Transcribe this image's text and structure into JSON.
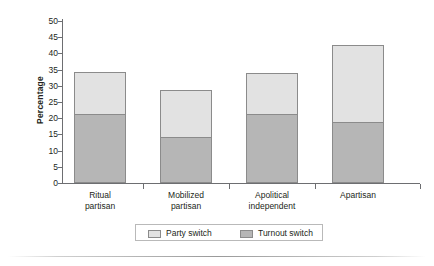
{
  "chart_data": {
    "type": "bar",
    "stacked": true,
    "title": "",
    "xlabel": "",
    "ylabel": "Percentage",
    "ylim": [
      0,
      50
    ],
    "ytick_labels": [
      "0",
      "5",
      "10",
      "15",
      "20",
      "25",
      "30",
      "35",
      "40",
      "45",
      "50"
    ],
    "ytick_values": [
      0,
      5,
      10,
      15,
      20,
      25,
      30,
      35,
      40,
      45,
      50
    ],
    "grid": false,
    "legend_position": "bottom",
    "categories": [
      "Ritual partisan",
      "Mobilized partisan",
      "Apolitical independent",
      "Apartisan"
    ],
    "category_lines": [
      [
        "Ritual",
        "partisan"
      ],
      [
        "Mobilized",
        "partisan"
      ],
      [
        "Apolitical",
        "independent"
      ],
      [
        "Apartisan",
        ""
      ]
    ],
    "series": [
      {
        "name": "Turnout switch",
        "color": "#b6b6b6",
        "values": [
          21.0,
          14.0,
          21.0,
          18.5
        ]
      },
      {
        "name": "Party switch",
        "color": "#e2e2e2",
        "values": [
          13.3,
          14.7,
          12.8,
          24.0
        ]
      }
    ],
    "totals": [
      34.3,
      28.7,
      33.8,
      42.5
    ]
  },
  "legend": {
    "items": [
      {
        "label": "Party switch",
        "swatch": "light"
      },
      {
        "label": "Turnout switch",
        "swatch": "dark"
      }
    ]
  },
  "colors": {
    "light_segment": "#e2e2e2",
    "dark_segment": "#b6b6b6",
    "axis": "#6d6e71",
    "text": "#231f20",
    "background": "#ffffff"
  }
}
